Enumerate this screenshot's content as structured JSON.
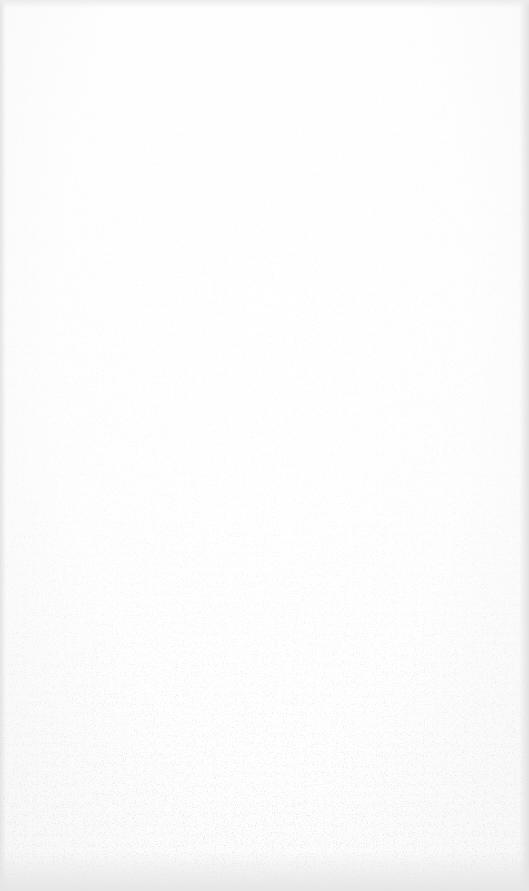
{
  "document": {
    "type": "blank scanned page",
    "text_content": [],
    "colors": {
      "paper": "#ffffff",
      "edge_shadow": "#e4e4e4",
      "speckle": "#9a9a9a"
    }
  }
}
